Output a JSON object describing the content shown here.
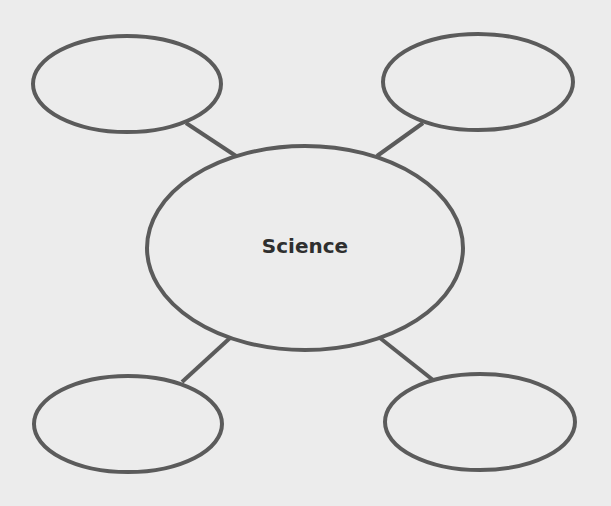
{
  "diagram": {
    "type": "bubble-map",
    "center": {
      "label": "Science"
    },
    "nodes": [
      {
        "id": "top-left",
        "label": ""
      },
      {
        "id": "top-right",
        "label": ""
      },
      {
        "id": "bottom-left",
        "label": ""
      },
      {
        "id": "bottom-right",
        "label": ""
      }
    ],
    "colors": {
      "stroke": "#5b5b5b",
      "background": "#ececec",
      "text": "#2f2f2f"
    }
  }
}
